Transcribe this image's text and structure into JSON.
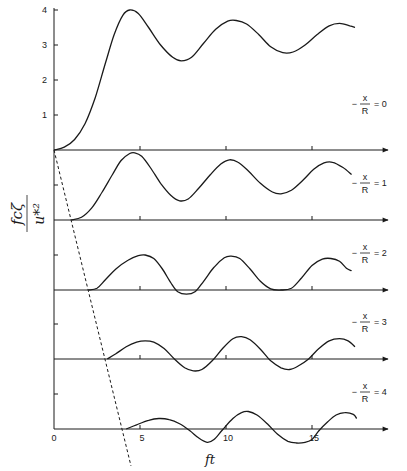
{
  "chart_data": {
    "type": "line",
    "title": "",
    "xlabel": "ft",
    "ylabel": "fcζ / u*²",
    "xlim": [
      0,
      18
    ],
    "x_ticks": [
      0,
      5,
      10,
      15
    ],
    "y_ticks_top_panel": [
      1,
      2,
      3,
      4
    ],
    "grid": false,
    "legend_position": "right (per-panel labels)",
    "panel_spacing_units": 2,
    "dashed_line": {
      "description": "onset line across panels",
      "points": [
        [
          0,
          0
        ],
        [
          4.5,
          -4.9
        ]
      ]
    },
    "series": [
      {
        "name": "-x/R = 0",
        "label_prefix": "−",
        "label_var": "x",
        "label_den": "R",
        "label_value": "= 0",
        "points": [
          [
            0,
            0
          ],
          [
            0.6,
            0.08
          ],
          [
            1.2,
            0.3
          ],
          [
            1.8,
            0.75
          ],
          [
            2.4,
            1.5
          ],
          [
            3.0,
            2.5
          ],
          [
            3.5,
            3.3
          ],
          [
            4.0,
            3.85
          ],
          [
            4.4,
            4.0
          ],
          [
            4.9,
            3.9
          ],
          [
            5.5,
            3.5
          ],
          [
            6.2,
            3.0
          ],
          [
            6.9,
            2.65
          ],
          [
            7.4,
            2.55
          ],
          [
            8.0,
            2.65
          ],
          [
            8.7,
            3.05
          ],
          [
            9.4,
            3.45
          ],
          [
            10.1,
            3.68
          ],
          [
            10.6,
            3.7
          ],
          [
            11.2,
            3.6
          ],
          [
            11.9,
            3.3
          ],
          [
            12.6,
            2.95
          ],
          [
            13.3,
            2.78
          ],
          [
            13.9,
            2.8
          ],
          [
            14.6,
            3.0
          ],
          [
            15.3,
            3.3
          ],
          [
            16.0,
            3.55
          ],
          [
            16.6,
            3.62
          ],
          [
            17.2,
            3.55
          ],
          [
            17.5,
            3.5
          ]
        ]
      },
      {
        "name": "-x/R = 1",
        "label_prefix": "−",
        "label_var": "x",
        "label_den": "R",
        "label_value": "= 1",
        "points": [
          [
            1.0,
            0
          ],
          [
            1.6,
            0.08
          ],
          [
            2.2,
            0.35
          ],
          [
            2.8,
            0.8
          ],
          [
            3.4,
            1.3
          ],
          [
            3.9,
            1.7
          ],
          [
            4.4,
            1.9
          ],
          [
            4.7,
            1.92
          ],
          [
            5.1,
            1.82
          ],
          [
            5.6,
            1.5
          ],
          [
            6.2,
            1.05
          ],
          [
            6.8,
            0.7
          ],
          [
            7.3,
            0.55
          ],
          [
            7.8,
            0.6
          ],
          [
            8.4,
            0.9
          ],
          [
            9.1,
            1.3
          ],
          [
            9.7,
            1.6
          ],
          [
            10.2,
            1.72
          ],
          [
            10.7,
            1.65
          ],
          [
            11.3,
            1.4
          ],
          [
            12.0,
            1.05
          ],
          [
            12.7,
            0.8
          ],
          [
            13.2,
            0.75
          ],
          [
            13.8,
            0.85
          ],
          [
            14.5,
            1.15
          ],
          [
            15.1,
            1.45
          ],
          [
            15.7,
            1.63
          ],
          [
            16.2,
            1.65
          ],
          [
            16.8,
            1.5
          ],
          [
            17.3,
            1.3
          ]
        ]
      },
      {
        "name": "-x/R = 2",
        "label_prefix": "−",
        "label_var": "x",
        "label_den": "R",
        "label_value": "= 2",
        "points": [
          [
            2.0,
            0
          ],
          [
            2.5,
            0.05
          ],
          [
            3.0,
            0.3
          ],
          [
            3.6,
            0.6
          ],
          [
            4.3,
            0.85
          ],
          [
            4.9,
            0.98
          ],
          [
            5.3,
            1.0
          ],
          [
            5.8,
            0.9
          ],
          [
            6.3,
            0.6
          ],
          [
            6.8,
            0.2
          ],
          [
            7.2,
            -0.05
          ],
          [
            7.7,
            -0.12
          ],
          [
            8.2,
            -0.05
          ],
          [
            8.7,
            0.25
          ],
          [
            9.3,
            0.65
          ],
          [
            9.9,
            0.92
          ],
          [
            10.3,
            0.97
          ],
          [
            10.8,
            0.9
          ],
          [
            11.4,
            0.6
          ],
          [
            12.0,
            0.25
          ],
          [
            12.6,
            0.03
          ],
          [
            13.2,
            0
          ],
          [
            13.8,
            0.05
          ],
          [
            14.4,
            0.35
          ],
          [
            15.0,
            0.7
          ],
          [
            15.6,
            0.88
          ],
          [
            16.1,
            0.9
          ],
          [
            16.6,
            0.82
          ],
          [
            17.0,
            0.62
          ],
          [
            17.3,
            0.55
          ]
        ]
      },
      {
        "name": "-x/R = 3",
        "label_prefix": "−",
        "label_var": "x",
        "label_den": "R",
        "label_value": "= 3",
        "points": [
          [
            3.1,
            0
          ],
          [
            3.6,
            0.15
          ],
          [
            4.2,
            0.35
          ],
          [
            4.8,
            0.48
          ],
          [
            5.3,
            0.52
          ],
          [
            5.8,
            0.48
          ],
          [
            6.4,
            0.3
          ],
          [
            7.0,
            0
          ],
          [
            7.6,
            -0.25
          ],
          [
            8.1,
            -0.34
          ],
          [
            8.6,
            -0.3
          ],
          [
            9.2,
            -0.05
          ],
          [
            9.8,
            0.3
          ],
          [
            10.4,
            0.58
          ],
          [
            10.9,
            0.64
          ],
          [
            11.4,
            0.55
          ],
          [
            12.0,
            0.28
          ],
          [
            12.6,
            -0.05
          ],
          [
            13.2,
            -0.25
          ],
          [
            13.7,
            -0.3
          ],
          [
            14.2,
            -0.2
          ],
          [
            14.8,
            0
          ],
          [
            15.4,
            0.3
          ],
          [
            16.0,
            0.52
          ],
          [
            16.6,
            0.58
          ],
          [
            17.1,
            0.52
          ],
          [
            17.5,
            0.35
          ]
        ]
      },
      {
        "name": "-x/R = 4",
        "label_prefix": "−",
        "label_var": "x",
        "label_den": "R",
        "label_value": "= 4",
        "points": [
          [
            4.2,
            0
          ],
          [
            4.8,
            0.12
          ],
          [
            5.5,
            0.25
          ],
          [
            6.1,
            0.3
          ],
          [
            6.7,
            0.27
          ],
          [
            7.3,
            0.15
          ],
          [
            7.9,
            -0.05
          ],
          [
            8.4,
            -0.25
          ],
          [
            8.9,
            -0.38
          ],
          [
            9.3,
            -0.3
          ],
          [
            9.8,
            -0.02
          ],
          [
            10.4,
            0.3
          ],
          [
            10.9,
            0.47
          ],
          [
            11.3,
            0.5
          ],
          [
            11.8,
            0.4
          ],
          [
            12.4,
            0.15
          ],
          [
            13.0,
            -0.15
          ],
          [
            13.6,
            -0.35
          ],
          [
            14.1,
            -0.4
          ],
          [
            14.6,
            -0.38
          ],
          [
            15.0,
            -0.3
          ],
          [
            15.4,
            -0.05
          ],
          [
            15.9,
            0.2
          ],
          [
            16.4,
            0.4
          ],
          [
            16.9,
            0.47
          ],
          [
            17.4,
            0.42
          ],
          [
            17.6,
            0.3
          ]
        ]
      }
    ]
  },
  "axes": {
    "x_tick_labels": [
      "0",
      "5",
      "10",
      "15"
    ],
    "y_tick_labels": [
      "1",
      "2",
      "3",
      "4"
    ],
    "xlabel": "ft",
    "ylabel_num": "fcζ",
    "ylabel_den": "u*²"
  }
}
